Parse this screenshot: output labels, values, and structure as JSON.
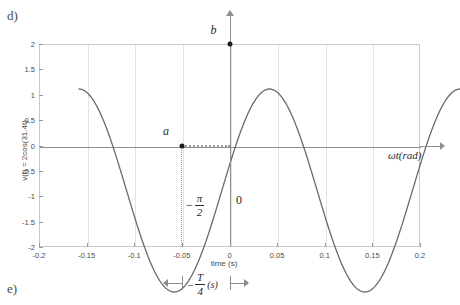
{
  "part_labels": {
    "top": "d)",
    "bottom": "e)"
  },
  "chart_data": {
    "type": "line",
    "title": "",
    "expression": "v(t) = 2cos(31.4t)",
    "amplitude": 2,
    "angular_frequency": 31.4,
    "period_s": 0.2,
    "xlabel": "time (s)",
    "ylabel": "v(t) = 2cos(31.4t)",
    "secondary_xlabel": "ωt(rad)",
    "xlim": [
      -0.2,
      0.2
    ],
    "ylim": [
      -2,
      2
    ],
    "grid": true,
    "legend": "none",
    "x_ticks": [
      "-0.2",
      "-0.15",
      "-0.1",
      "-0.05",
      "0",
      "0.05",
      "0.1",
      "0.15",
      "0.2"
    ],
    "x_tick_values": [
      -0.2,
      -0.15,
      -0.1,
      -0.05,
      0,
      0.05,
      0.1,
      0.15,
      0.2
    ],
    "y_ticks": [
      "2",
      "1.5",
      "1",
      "0.5",
      "0",
      "-0.5",
      "-1",
      "-1.5",
      "-2"
    ],
    "y_tick_values": [
      2,
      1.5,
      1,
      0.5,
      0,
      -0.5,
      -1,
      -1.5,
      -2
    ],
    "series": [
      {
        "name": "v(t) = 2cos(31.4t)",
        "color": "#6a6a6a",
        "x": [
          -0.2,
          -0.19,
          -0.18,
          -0.17,
          -0.16,
          -0.15,
          -0.14,
          -0.13,
          -0.12,
          -0.11,
          -0.1,
          -0.09,
          -0.08,
          -0.07,
          -0.06,
          -0.05,
          -0.04,
          -0.03,
          -0.02,
          -0.01,
          0,
          0.01,
          0.02,
          0.03,
          0.04,
          0.05,
          0.06,
          0.07,
          0.08,
          0.09,
          0.1,
          0.11,
          0.12,
          0.13,
          0.14,
          0.15,
          0.16,
          0.17,
          0.18,
          0.19,
          0.2
        ],
        "y": [
          2,
          1.902,
          1.618,
          1.176,
          0.618,
          0,
          -0.618,
          -1.176,
          -1.618,
          -1.902,
          -2,
          -1.902,
          -1.618,
          -1.176,
          -0.618,
          0,
          0.618,
          1.176,
          1.618,
          1.902,
          2,
          1.902,
          1.618,
          1.176,
          0.618,
          0,
          -0.618,
          -1.176,
          -1.618,
          -1.902,
          -2,
          -1.902,
          -1.618,
          -1.176,
          -0.618,
          0,
          0.618,
          1.176,
          1.618,
          1.902,
          2
        ]
      }
    ],
    "annotations": [
      {
        "name": "b",
        "label": "b",
        "x": 0,
        "y": 2,
        "description": "peak marker at origin on vertical axis"
      },
      {
        "name": "a",
        "label": "a",
        "x": -0.05,
        "y": 0,
        "description": "rising zero crossing marker"
      },
      {
        "name": "phase",
        "label": "-π/2",
        "numerator": "π",
        "denominator": "2",
        "sign": "−",
        "description": "phase offset between a and origin"
      },
      {
        "name": "origin",
        "label": "0",
        "description": "origin label right of vertical axis"
      },
      {
        "name": "quarter-period",
        "sign": "−",
        "numerator": "T",
        "denominator": "4",
        "unit": "(s)",
        "label": "-T/4 (s)",
        "description": "interval marker spanning from t=-0.05 to t=0"
      }
    ]
  }
}
